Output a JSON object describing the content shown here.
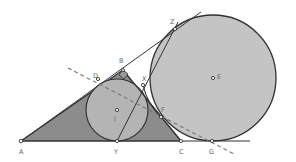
{
  "diagram": {
    "type": "geometry",
    "colors": {
      "triangle_fill": "#8c8c8c",
      "incircle_fill": "#b4b4b4",
      "excircle_fill": "#c4c4c4",
      "stroke": "#333333",
      "dashed": "#777777",
      "label": "#666666"
    },
    "points": [
      {
        "id": "A",
        "label": "A",
        "x": 21,
        "y": 141
      },
      {
        "id": "B",
        "label": "B",
        "x": 123,
        "y": 70
      },
      {
        "id": "C",
        "label": "C",
        "x": 181,
        "y": 141
      },
      {
        "id": "D",
        "label": "D",
        "x": 98,
        "y": 79
      },
      {
        "id": "E",
        "label": "E",
        "x": 213,
        "y": 78
      },
      {
        "id": "F",
        "label": "F",
        "x": 161,
        "y": 117
      },
      {
        "id": "G",
        "label": "G",
        "x": 212,
        "y": 141
      },
      {
        "id": "I",
        "label": "I",
        "x": 117,
        "y": 110
      },
      {
        "id": "X",
        "label": "X",
        "x": 143,
        "y": 85
      },
      {
        "id": "Y",
        "label": "Y",
        "x": 117,
        "y": 141
      },
      {
        "id": "Z",
        "label": "Z",
        "x": 175,
        "y": 29
      }
    ],
    "circles": [
      {
        "id": "incircle",
        "center": "I",
        "r": 31
      },
      {
        "id": "excircle",
        "center": "E",
        "r": 63
      }
    ],
    "right_angle_at": "B"
  }
}
